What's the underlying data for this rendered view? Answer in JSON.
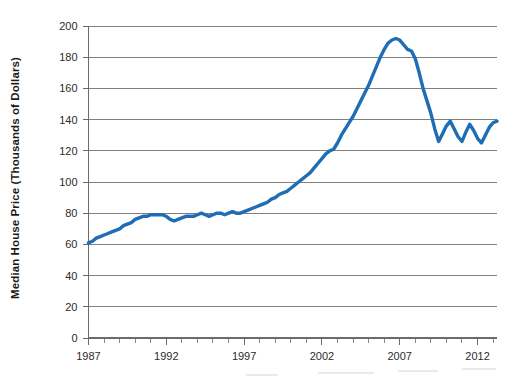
{
  "chart_data": {
    "type": "line",
    "title": "",
    "subtitle": "",
    "xlabel": "",
    "ylabel": "Median House Price (Thousands of Dollars)",
    "ylim": [
      0,
      200
    ],
    "xlim": [
      1987,
      2013.25
    ],
    "grid": true,
    "legend": false,
    "legend_position": "none",
    "y_ticks": [
      0,
      20,
      40,
      60,
      80,
      100,
      120,
      140,
      160,
      180,
      200
    ],
    "y_tick_labels": [
      "0",
      "20",
      "40",
      "60",
      "80",
      "100",
      "120",
      "140",
      "160",
      "180",
      "200"
    ],
    "x_ticks": [
      1987,
      1992,
      1997,
      2002,
      2007,
      2012
    ],
    "x_tick_labels": [
      "1987",
      "1992",
      "1997",
      "2002",
      "2007",
      "2012"
    ],
    "x_minor_tick_interval": 1,
    "line_color": "#1f6eb5",
    "series": [
      {
        "name": "Median House Price",
        "x": [
          1987.0,
          1987.25,
          1987.5,
          1987.75,
          1988.0,
          1988.25,
          1988.5,
          1988.75,
          1989.0,
          1989.25,
          1989.5,
          1989.75,
          1990.0,
          1990.25,
          1990.5,
          1990.75,
          1991.0,
          1991.25,
          1991.5,
          1991.75,
          1992.0,
          1992.25,
          1992.5,
          1992.75,
          1993.0,
          1993.25,
          1993.5,
          1993.75,
          1994.0,
          1994.25,
          1994.5,
          1994.75,
          1995.0,
          1995.25,
          1995.5,
          1995.75,
          1996.0,
          1996.25,
          1996.5,
          1996.75,
          1997.0,
          1997.25,
          1997.5,
          1997.75,
          1998.0,
          1998.25,
          1998.5,
          1998.75,
          1999.0,
          1999.25,
          1999.5,
          1999.75,
          2000.0,
          2000.25,
          2000.5,
          2000.75,
          2001.0,
          2001.25,
          2001.5,
          2001.75,
          2002.0,
          2002.25,
          2002.5,
          2002.75,
          2003.0,
          2003.25,
          2003.5,
          2003.75,
          2004.0,
          2004.25,
          2004.5,
          2004.75,
          2005.0,
          2005.25,
          2005.5,
          2005.75,
          2006.0,
          2006.25,
          2006.5,
          2006.75,
          2007.0,
          2007.25,
          2007.5,
          2007.75,
          2008.0,
          2008.25,
          2008.5,
          2008.75,
          2009.0,
          2009.25,
          2009.5,
          2009.75,
          2010.0,
          2010.25,
          2010.5,
          2010.75,
          2011.0,
          2011.25,
          2011.5,
          2011.75,
          2012.0,
          2012.25,
          2012.5,
          2012.75,
          2013.0,
          2013.25
        ],
        "values": [
          61,
          62,
          64,
          65,
          66,
          67,
          68,
          69,
          70,
          72,
          73,
          74,
          76,
          77,
          78,
          78,
          79,
          79,
          79,
          79,
          78,
          76,
          75,
          76,
          77,
          78,
          78,
          78,
          79,
          80,
          79,
          78,
          79,
          80,
          80,
          79,
          80,
          81,
          80,
          80,
          81,
          82,
          83,
          84,
          85,
          86,
          87,
          89,
          90,
          92,
          93,
          94,
          96,
          98,
          100,
          102,
          104,
          106,
          109,
          112,
          115,
          118,
          120,
          121,
          125,
          130,
          134,
          138,
          142,
          147,
          152,
          157,
          162,
          168,
          174,
          180,
          185,
          189,
          191,
          192,
          191,
          188,
          185,
          184,
          179,
          170,
          160,
          152,
          144,
          134,
          126,
          131,
          136,
          139,
          134,
          129,
          126,
          132,
          137,
          133,
          128,
          125,
          130,
          135,
          138,
          139
        ]
      }
    ],
    "annotations": []
  },
  "axis": {
    "y_title": "Median House Price (Thousands of Dollars)"
  },
  "colors": {
    "line": "#1f6eb5",
    "grid": "#808080",
    "axis": "#6b6b6b",
    "text": "#2b2b2b",
    "background": "#ffffff"
  }
}
